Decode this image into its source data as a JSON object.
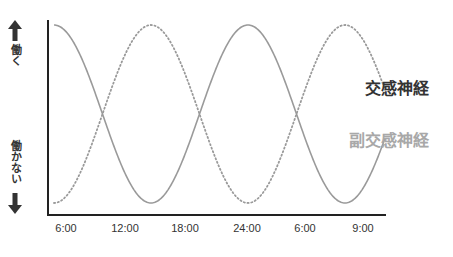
{
  "chart_data": {
    "type": "line",
    "title": "",
    "xlabel": "",
    "ylabel": "",
    "y_top_label": "働く",
    "y_bottom_label": "働かない",
    "categories": [
      "6:00",
      "12:00",
      "18:00",
      "24:00",
      "6:00",
      "9:00"
    ],
    "ylim": [
      0,
      1
    ],
    "grid": false,
    "legend_position": "right, inline labels",
    "series": [
      {
        "name": "交感神経",
        "style": "solid",
        "color": "#999999",
        "label_color": "#333333",
        "description": "cosine wave: high at 6:00, low at 12:00, high at 24:00 region peak, low again, rising at end",
        "x": [
          0,
          0.5,
          1,
          1.5,
          2,
          2.5,
          3,
          3.5
        ],
        "values": [
          1,
          0.5,
          0,
          0.5,
          1,
          0.5,
          0,
          0.3
        ]
      },
      {
        "name": "副交感神経",
        "style": "dotted",
        "color": "#999999",
        "label_color": "#aaaaaa",
        "description": "inverse cosine wave: low at 6:00, high at 12:00, low, high, falling at end",
        "x": [
          0,
          0.5,
          1,
          1.5,
          2,
          2.5,
          3,
          3.5
        ],
        "values": [
          0,
          0.5,
          1,
          0.5,
          0,
          0.5,
          1,
          0.7
        ]
      }
    ]
  },
  "labels": {
    "y_top": "働く",
    "y_bottom": "働かない",
    "legend_sympathetic": "交感神経",
    "legend_parasympathetic": "副交感神経",
    "x_ticks": [
      "6:00",
      "12:00",
      "18:00",
      "24:00",
      "6:00",
      "9:00"
    ]
  },
  "colors": {
    "axis": "#222222",
    "curve": "#9a9a9a",
    "arrow": "#333333",
    "sympathetic_label": "#333333",
    "parasympathetic_label": "#a8a8a8"
  }
}
